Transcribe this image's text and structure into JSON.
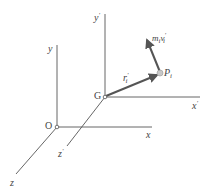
{
  "diagram": {
    "title": "",
    "origins": {
      "O": {
        "label": "O",
        "x": 57,
        "y": 127
      },
      "G": {
        "label": "G",
        "x": 105,
        "y": 97
      }
    },
    "axes_fixed": {
      "x": {
        "label": "x"
      },
      "y": {
        "label": "y"
      },
      "z": {
        "label": "z"
      }
    },
    "axes_moving": {
      "x_prime": {
        "label": "x",
        "prime": "′"
      },
      "y_prime": {
        "label": "y",
        "prime": "′"
      },
      "z_prime": {
        "label": "z",
        "prime": "′"
      }
    },
    "point": {
      "label": "P",
      "sub": "i"
    },
    "vectors": {
      "position": {
        "label": "r",
        "prime": "′",
        "sub": "i",
        "from": "G",
        "to": "P_i"
      },
      "momentum": {
        "label_m": "m",
        "m_sub": "i",
        "label_v": "v",
        "prime": "′",
        "v_sub": "i",
        "from": "P_i"
      }
    },
    "colors": {
      "axis": "#555555",
      "vector": "#555555",
      "point": "#bbbbbb",
      "text": "#444444"
    }
  }
}
